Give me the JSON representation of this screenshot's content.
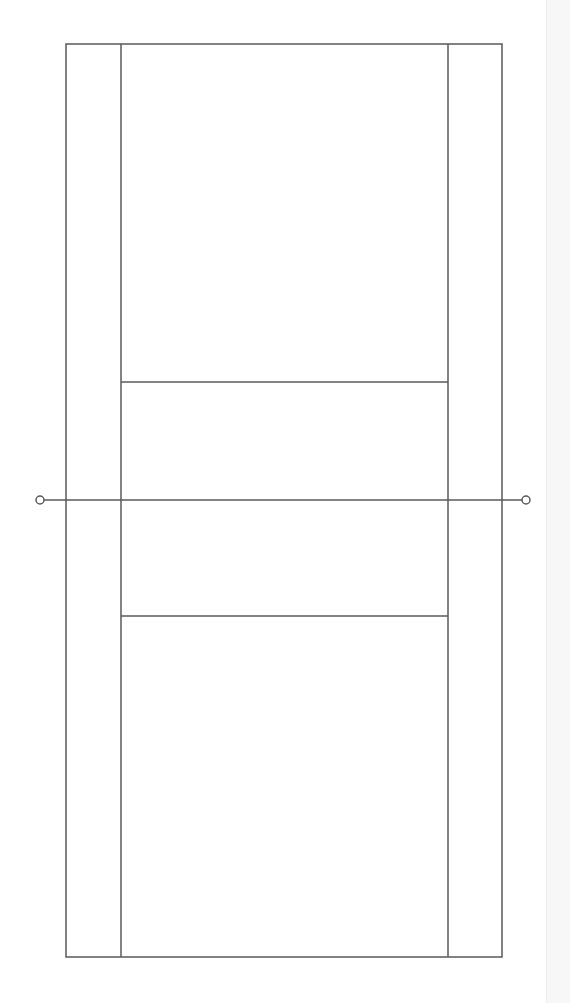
{
  "diagram": {
    "type": "court-diagram",
    "colors": {
      "background": "#ffffff",
      "line": "#5a5a5a",
      "right_strip": "#f7f7f7"
    },
    "court": {
      "outer": {
        "x1": 66,
        "y1": 44,
        "x2": 502,
        "y2": 957
      },
      "side_lines": [
        121,
        448
      ],
      "service_lines": [
        382,
        616
      ],
      "net": {
        "y": 500,
        "x1": 44,
        "x2": 522
      },
      "posts": [
        {
          "cx": 40,
          "cy": 500,
          "r": 4
        },
        {
          "cx": 526,
          "cy": 500,
          "r": 4
        }
      ]
    }
  }
}
